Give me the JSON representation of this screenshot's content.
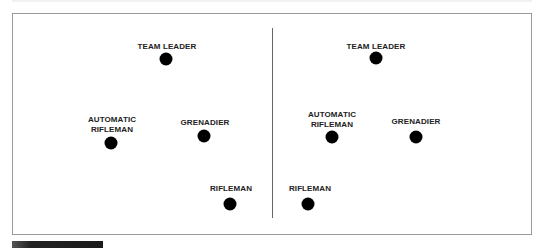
{
  "diagram": {
    "title": "",
    "panels": [
      {
        "name": "left-formation",
        "members": [
          {
            "role": "team-leader",
            "label_lines": [
              "TEAM LEADER"
            ],
            "label": "TEAM LEADER"
          },
          {
            "role": "automatic-rifleman",
            "label_lines": [
              "AUTOMATIC",
              "RIFLEMAN"
            ],
            "label": "AUTOMATIC RIFLEMAN"
          },
          {
            "role": "grenadier",
            "label_lines": [
              "GRENADIER"
            ],
            "label": "GRENADIER"
          },
          {
            "role": "rifleman",
            "label_lines": [
              "RIFLEMAN"
            ],
            "label": "RIFLEMAN"
          }
        ]
      },
      {
        "name": "right-formation",
        "members": [
          {
            "role": "team-leader",
            "label_lines": [
              "TEAM LEADER"
            ],
            "label": "TEAM LEADER"
          },
          {
            "role": "automatic-rifleman",
            "label_lines": [
              "AUTOMATIC",
              "RIFLEMAN"
            ],
            "label": "AUTOMATIC RIFLEMAN"
          },
          {
            "role": "grenadier",
            "label_lines": [
              "GRENADIER"
            ],
            "label": "GRENADIER"
          },
          {
            "role": "rifleman",
            "label_lines": [
              "RIFLEMAN"
            ],
            "label": "RIFLEMAN"
          }
        ]
      }
    ],
    "colors": {
      "dot": "#000000",
      "label": "#222222",
      "frame_border": "#9a9a9a",
      "divider": "#666666"
    }
  }
}
